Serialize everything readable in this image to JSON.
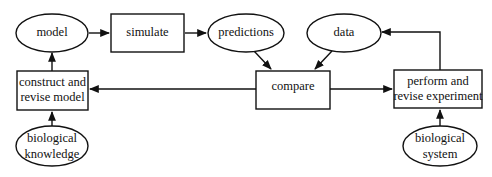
{
  "diagram": {
    "nodes": [
      {
        "id": "model",
        "shape": "ellipse",
        "lines": [
          "model"
        ]
      },
      {
        "id": "simulate",
        "shape": "rect",
        "lines": [
          "simulate"
        ]
      },
      {
        "id": "predictions",
        "shape": "ellipse",
        "lines": [
          "predictions"
        ]
      },
      {
        "id": "data",
        "shape": "ellipse",
        "lines": [
          "data"
        ]
      },
      {
        "id": "construct",
        "shape": "rect",
        "lines": [
          "construct and",
          "revise model"
        ]
      },
      {
        "id": "compare",
        "shape": "rect",
        "lines": [
          "compare"
        ]
      },
      {
        "id": "perform",
        "shape": "rect",
        "lines": [
          "perform and",
          "revise experiment"
        ]
      },
      {
        "id": "bio_knowledge",
        "shape": "ellipse",
        "lines": [
          "biological",
          "knowledge"
        ]
      },
      {
        "id": "bio_system",
        "shape": "ellipse",
        "lines": [
          "biological",
          "system"
        ]
      }
    ],
    "edges": [
      {
        "from": "model",
        "to": "simulate"
      },
      {
        "from": "simulate",
        "to": "predictions"
      },
      {
        "from": "predictions",
        "to": "compare"
      },
      {
        "from": "data",
        "to": "compare"
      },
      {
        "from": "compare",
        "to": "construct"
      },
      {
        "from": "compare",
        "to": "perform"
      },
      {
        "from": "construct",
        "to": "model"
      },
      {
        "from": "bio_knowledge",
        "to": "construct"
      },
      {
        "from": "perform",
        "to": "data"
      },
      {
        "from": "bio_system",
        "to": "perform"
      }
    ],
    "colors": {
      "stroke": "#111111",
      "fill": "#ffffff",
      "background": "#ffffff"
    }
  }
}
